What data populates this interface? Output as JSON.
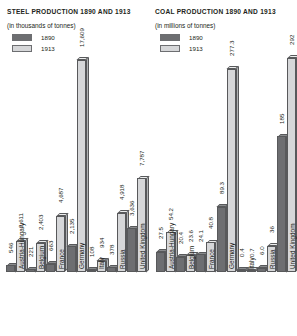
{
  "panels": {
    "steel": {
      "title": "STEEL PRODUCTION 1890 AND 1913",
      "subtitle": "(in thousands of tonnes)",
      "legend": [
        {
          "label": "1890",
          "color": "#6d6e71"
        },
        {
          "label": "1913",
          "color": "#d6d7d9"
        }
      ]
    },
    "coal": {
      "title": "COAL PRODUCTION 1890 AND 1913",
      "subtitle": "(in millions of tonnes)",
      "legend": [
        {
          "label": "1890",
          "color": "#6d6e71"
        },
        {
          "label": "1913",
          "color": "#d6d7d9"
        }
      ]
    }
  },
  "chart_data": [
    {
      "type": "bar",
      "title": "STEEL PRODUCTION 1890 AND 1913",
      "subtitle": "(in thousands of tonnes)",
      "xlabel": "",
      "ylabel": "thousands of tonnes",
      "categories": [
        "Austria-Hungary",
        "Belgium",
        "France",
        "Germany",
        "Italy",
        "Russia",
        "United Kingdom"
      ],
      "series": [
        {
          "name": "1890",
          "color": "#6d6e71",
          "values": [
            546,
            221,
            663,
            2135,
            108,
            378,
            3636
          ]
        },
        {
          "name": "1913",
          "color": "#d6d7d9",
          "values": [
            2611,
            2403,
            4687,
            17609,
            934,
            4918,
            7787
          ]
        }
      ],
      "labels": {
        "1890": [
          "546",
          "221",
          "663",
          "2,135",
          "108",
          "378",
          "3,636"
        ],
        "1913": [
          "2,611",
          "2,403",
          "4,687",
          "17,609",
          "934",
          "4,918",
          "7,787"
        ]
      },
      "ylim": [
        0,
        17609
      ],
      "grid": false,
      "legend_position": "top-left"
    },
    {
      "type": "bar",
      "title": "COAL PRODUCTION 1890 AND 1913",
      "subtitle": "(in millions of tonnes)",
      "xlabel": "",
      "ylabel": "millions of tonnes",
      "categories": [
        "Austria-Hungary",
        "Belgium",
        "France",
        "Germany",
        "Italy",
        "Russia",
        "United Kingdom"
      ],
      "series": [
        {
          "name": "1890",
          "color": "#6d6e71",
          "values": [
            27.5,
            20.4,
            24.1,
            89.3,
            0.4,
            6.0,
            185
          ]
        },
        {
          "name": "1913",
          "color": "#d6d7d9",
          "values": [
            54.2,
            23.6,
            40.8,
            277.3,
            0.7,
            36,
            292
          ]
        }
      ],
      "labels": {
        "1890": [
          "27.5",
          "20.4",
          "24.1",
          "89.3",
          "0.4",
          "6.0",
          "185"
        ],
        "1913": [
          "54.2",
          "23.6",
          "40.8",
          "277.3",
          "0.7",
          "36",
          "292"
        ]
      },
      "ylim": [
        0,
        292
      ],
      "grid": false,
      "legend_position": "top-left"
    }
  ]
}
